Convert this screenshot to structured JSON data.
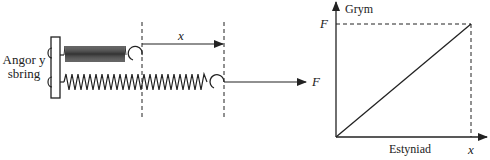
{
  "diagram": {
    "left": {
      "anchor_label_line1": "Angor y",
      "anchor_label_line2": "sbring",
      "extension_label": "x",
      "force_label": "F"
    },
    "graph": {
      "y_axis_label": "Grym",
      "x_axis_label": "Estyniad",
      "y_tick_label": "F",
      "x_tick_label": "x"
    },
    "colors": {
      "ink": "#222222",
      "background": "#ffffff"
    }
  }
}
